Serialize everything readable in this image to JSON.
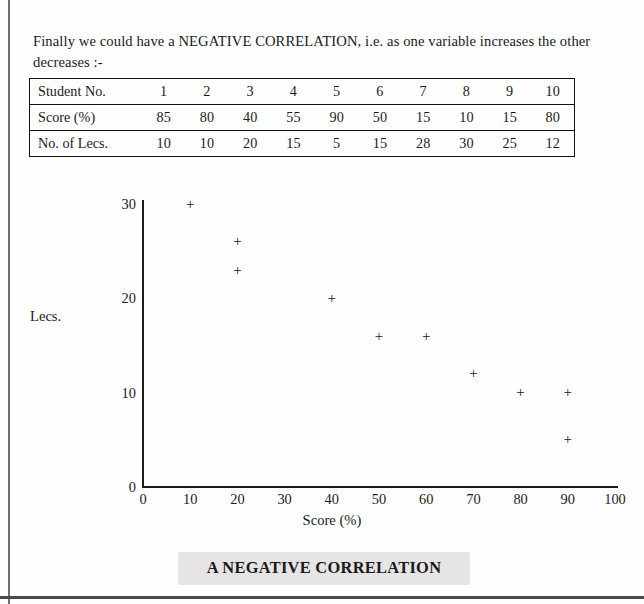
{
  "document": {
    "intro_text": "Finally we could have a NEGATIVE CORRELATION, i.e. as one variable increases the other decreases :-",
    "caption": "A NEGATIVE CORRELATION"
  },
  "table": {
    "rows": [
      {
        "header": "Student No.",
        "values": [
          "1",
          "2",
          "3",
          "4",
          "5",
          "6",
          "7",
          "8",
          "9",
          "10"
        ]
      },
      {
        "header": "Score (%)",
        "values": [
          "85",
          "80",
          "40",
          "55",
          "90",
          "50",
          "15",
          "10",
          "15",
          "80"
        ]
      },
      {
        "header": "No. of Lecs.",
        "values": [
          "10",
          "10",
          "20",
          "15",
          "5",
          "15",
          "28",
          "30",
          "25",
          "12"
        ]
      }
    ]
  },
  "chart_data": {
    "type": "scatter",
    "title": "A NEGATIVE CORRELATION",
    "xlabel": "Score (%)",
    "ylabel": "Lecs.",
    "xlim": [
      0,
      100
    ],
    "ylim": [
      0,
      32
    ],
    "xticks": [
      "0",
      "10",
      "20",
      "30",
      "40",
      "50",
      "60",
      "70",
      "80",
      "90",
      "100"
    ],
    "xtick_values": [
      0,
      10,
      20,
      30,
      40,
      50,
      60,
      70,
      80,
      90,
      100
    ],
    "yticks": [
      "0",
      "10",
      "20",
      "30"
    ],
    "ytick_values": [
      0,
      10,
      20,
      30
    ],
    "grid": false,
    "legend": false,
    "marker": "+",
    "marker_color": "#161616",
    "series": [
      {
        "name": "Students",
        "points": [
          {
            "x": 10,
            "y": 30,
            "student": "8"
          },
          {
            "x": 20,
            "y": 26,
            "student": "7"
          },
          {
            "x": 20,
            "y": 23,
            "student": "9"
          },
          {
            "x": 40,
            "y": 20,
            "student": "3"
          },
          {
            "x": 50,
            "y": 16,
            "student": "6"
          },
          {
            "x": 60,
            "y": 16,
            "student": "4"
          },
          {
            "x": 70,
            "y": 12,
            "student": "10"
          },
          {
            "x": 80,
            "y": 10,
            "student": "2"
          },
          {
            "x": 90,
            "y": 10,
            "student": "1"
          },
          {
            "x": 90,
            "y": 5,
            "student": "5"
          }
        ]
      }
    ]
  }
}
